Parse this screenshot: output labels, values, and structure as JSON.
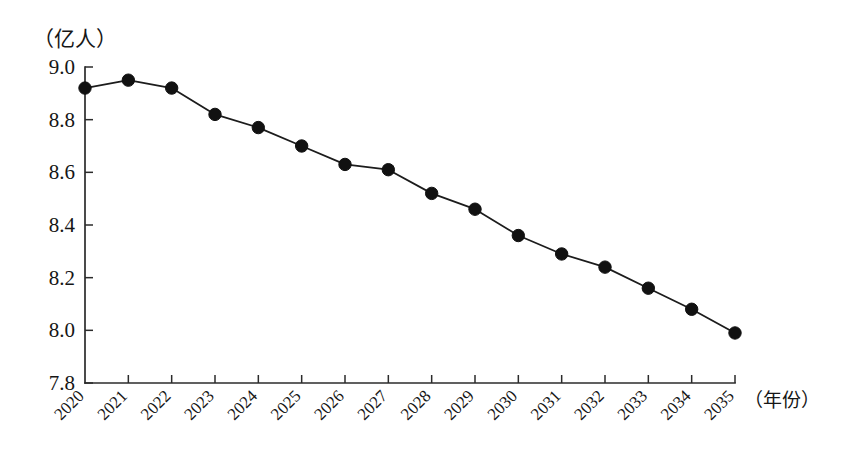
{
  "chart_data": {
    "type": "line",
    "title": "",
    "xlabel": "（年份）",
    "ylabel": "（亿人）",
    "categories": [
      "2020",
      "2021",
      "2022",
      "2023",
      "2024",
      "2025",
      "2026",
      "2027",
      "2028",
      "2029",
      "2030",
      "2031",
      "2032",
      "2033",
      "2034",
      "2035"
    ],
    "values": [
      8.92,
      8.95,
      8.92,
      8.82,
      8.77,
      8.7,
      8.63,
      8.61,
      8.52,
      8.46,
      8.36,
      8.29,
      8.24,
      8.16,
      8.08,
      7.99
    ],
    "series": [
      {
        "name": "劳动年龄人口",
        "values": [
          8.92,
          8.95,
          8.92,
          8.82,
          8.77,
          8.7,
          8.63,
          8.61,
          8.52,
          8.46,
          8.36,
          8.29,
          8.24,
          8.16,
          8.08,
          7.99
        ]
      }
    ],
    "ytick_labels": [
      "9.0",
      "8.8",
      "8.6",
      "8.4",
      "8.2",
      "8.0",
      "7.8"
    ],
    "ytick_values": [
      9.0,
      8.8,
      8.6,
      8.4,
      8.2,
      8.0,
      7.8
    ],
    "ylim": [
      7.8,
      9.0
    ],
    "xlim": [
      "2020",
      "2035"
    ],
    "grid": false,
    "legend": "none",
    "marker": "filled-circle",
    "line_color": "#1c1c1c",
    "marker_color": "#111111",
    "background_color": "#ffffff",
    "xtick_rotation_deg": 45
  },
  "axes": {
    "unit_label": "（亿人）",
    "year_label": "（年份）"
  }
}
